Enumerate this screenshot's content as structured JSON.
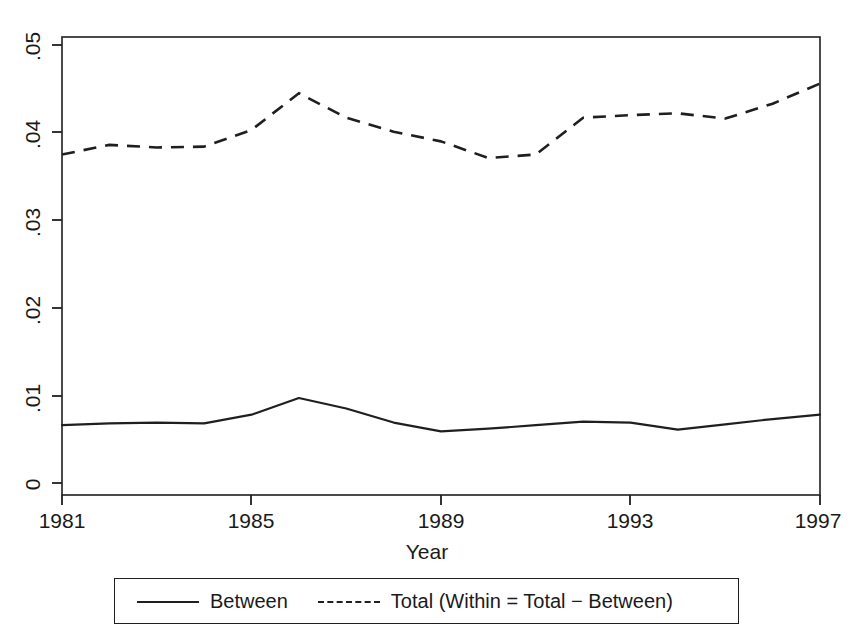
{
  "chart_data": {
    "type": "line",
    "title": "",
    "subtitle": "",
    "xlabel": "Year",
    "ylabel": "",
    "xlim": [
      1981,
      1997
    ],
    "ylim": [
      0,
      0.05
    ],
    "xticks": [
      "1981",
      "1985",
      "1989",
      "1993",
      "1997"
    ],
    "xtick_values": [
      1981,
      1985,
      1989,
      1993,
      1997
    ],
    "yticks": [
      "0",
      ".01",
      ".02",
      ".03",
      ".04",
      ".05"
    ],
    "ytick_values": [
      0,
      0.01,
      0.02,
      0.03,
      0.04,
      0.05
    ],
    "grid": false,
    "legend_position": "below-axes",
    "x": [
      1981,
      1982,
      1983,
      1984,
      1985,
      1986,
      1987,
      1988,
      1989,
      1990,
      1991,
      1992,
      1993,
      1994,
      1995,
      1996,
      1997
    ],
    "series": [
      {
        "name": "Between",
        "style": "solid",
        "color": "#1f1f1f",
        "values": [
          0.0066,
          0.0068,
          0.0069,
          0.0068,
          0.0078,
          0.0097,
          0.0085,
          0.0069,
          0.0059,
          0.0062,
          0.0066,
          0.007,
          0.0069,
          0.0061,
          0.0067,
          0.0073,
          0.0078
        ]
      },
      {
        "name": "Total (Within = Total − Between)",
        "style": "dashed",
        "color": "#1f1f1f",
        "values": [
          0.0375,
          0.0386,
          0.0383,
          0.0384,
          0.0403,
          0.0445,
          0.0417,
          0.0401,
          0.039,
          0.0371,
          0.0375,
          0.0417,
          0.042,
          0.0422,
          0.0416,
          0.0433,
          0.0456
        ]
      }
    ]
  },
  "legend": {
    "entries": [
      {
        "label": "Between",
        "style": "solid"
      },
      {
        "label": "Total (Within = Total − Between)",
        "style": "dashed"
      }
    ]
  },
  "axes": {
    "x_title": "Year"
  }
}
